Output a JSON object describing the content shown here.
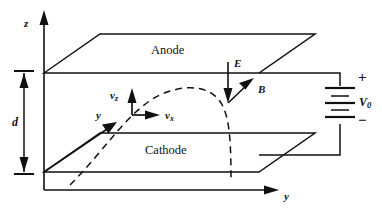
{
  "figure": {
    "stroke_color": "#111111",
    "background_color": "#ffffff"
  },
  "plates": {
    "anode": {
      "label": "Anode"
    },
    "cathode": {
      "label": "Cathode"
    }
  },
  "axes": {
    "z": {
      "label": "z"
    },
    "y_origin": {
      "label": "y"
    },
    "y_bottom": {
      "label": "y"
    }
  },
  "velocity_vectors": {
    "vz": {
      "base": "v",
      "subscript": "z"
    },
    "vx": {
      "base": "v",
      "subscript": "x"
    }
  },
  "fields": {
    "electric": {
      "label": "E",
      "direction": "down"
    },
    "magnetic": {
      "label": "B",
      "direction": "up-right"
    }
  },
  "dimension": {
    "gap": {
      "label": "d"
    }
  },
  "source": {
    "voltage": {
      "base": "V",
      "subscript": "0"
    },
    "positive_terminal": "+",
    "negative_terminal": "−"
  }
}
